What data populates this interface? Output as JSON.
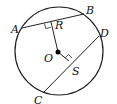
{
  "diagram": {
    "type": "circle-geometry",
    "circle": {
      "cx": 59,
      "cy": 51,
      "r": 44,
      "stroke": "#222222"
    },
    "center": {
      "label": "O",
      "x": 58,
      "y": 52
    },
    "points": {
      "A": {
        "label": "A",
        "x": 22,
        "y": 28
      },
      "B": {
        "label": "B",
        "x": 84,
        "y": 14
      },
      "C": {
        "label": "C",
        "x": 43,
        "y": 93
      },
      "D": {
        "label": "D",
        "x": 99,
        "y": 36
      },
      "R": {
        "label": "R",
        "x": 51,
        "y": 22
      },
      "S": {
        "label": "S",
        "x": 69,
        "y": 61
      }
    },
    "segments": [
      "AB",
      "CD",
      "OR",
      "OS"
    ],
    "right_angles": [
      "R",
      "S"
    ]
  }
}
